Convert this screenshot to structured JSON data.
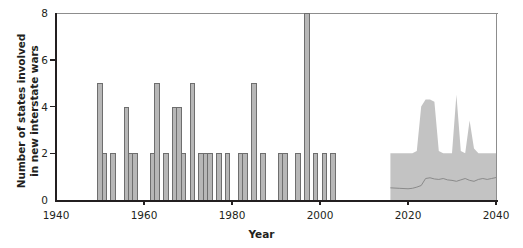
{
  "chart_data": {
    "type": "bar",
    "title": "",
    "xlabel": "Year",
    "ylabel": "Number of states involved\nin new interstate wars",
    "xlim": [
      1940,
      2040
    ],
    "ylim": [
      0,
      8
    ],
    "xticks": [
      1940,
      1960,
      1980,
      2000,
      2020,
      2040
    ],
    "xtick_labels": [
      "1940",
      "1960",
      "1980",
      "2000",
      "2020",
      "2040"
    ],
    "yticks": [
      0,
      2,
      4,
      6,
      8
    ],
    "ytick_labels": [
      "0",
      "2",
      "4",
      "6",
      "8"
    ],
    "grid": false,
    "legend": "none",
    "bar_color": "#b7b7b7",
    "bar_edge_color": "#6e6e6e",
    "band_color": "#c3c3c3",
    "median_line_color": "#8a8a8a",
    "axis_color": "#231f20",
    "historical_series": {
      "name": "Observed new interstate wars",
      "x": [
        1950,
        1951,
        1953,
        1956,
        1957,
        1958,
        1962,
        1963,
        1965,
        1967,
        1968,
        1969,
        1971,
        1973,
        1974,
        1975,
        1977,
        1979,
        1982,
        1983,
        1985,
        1987,
        1991,
        1992,
        1995,
        1997,
        1999,
        2001,
        2003
      ],
      "values": [
        5,
        2,
        2,
        4,
        2,
        2,
        2,
        5,
        2,
        4,
        4,
        2,
        5,
        2,
        2,
        2,
        2,
        2,
        2,
        2,
        5,
        2,
        2,
        2,
        2,
        8,
        2,
        2,
        2
      ]
    },
    "projection_band": {
      "name": "Projected range",
      "x_start": 2016,
      "x_end": 2040,
      "x": [
        2016,
        2018,
        2020,
        2021,
        2022,
        2023,
        2024,
        2025,
        2026,
        2027,
        2028,
        2029,
        2030,
        2031,
        2032,
        2033,
        2034,
        2035,
        2036,
        2037,
        2038,
        2039,
        2040
      ],
      "upper": [
        2.0,
        2.0,
        2.0,
        2.0,
        2.1,
        4.0,
        4.3,
        4.3,
        4.2,
        2.1,
        2.0,
        2.0,
        2.0,
        4.5,
        2.1,
        2.0,
        3.4,
        2.2,
        2.0,
        2.0,
        2.0,
        2.0,
        2.0
      ],
      "lower": [
        0.0,
        0.0,
        0.0,
        0.0,
        0.0,
        0.0,
        0.0,
        0.0,
        0.0,
        0.0,
        0.0,
        0.0,
        0.0,
        0.0,
        0.0,
        0.0,
        0.0,
        0.0,
        0.0,
        0.0,
        0.0,
        0.0,
        0.0
      ],
      "median": [
        0.52,
        0.5,
        0.48,
        0.5,
        0.55,
        0.62,
        0.92,
        0.95,
        0.9,
        0.88,
        0.92,
        0.86,
        0.84,
        0.8,
        0.86,
        0.92,
        0.84,
        0.8,
        0.88,
        0.92,
        0.88,
        0.92,
        0.96
      ]
    }
  }
}
